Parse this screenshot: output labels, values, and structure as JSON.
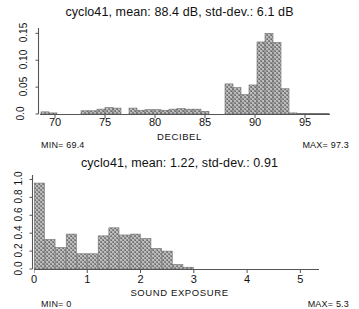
{
  "colors": {
    "bar_fill": "#a3a3a3",
    "bar_edge": "#6e6e6e",
    "axis": "#555555",
    "text": "#111111",
    "background": "#ffffff"
  },
  "panels": [
    {
      "id": "decibel",
      "title": "cyclo41,  mean: 88.4 dB,  std-dev.:  6.1 dB",
      "min_label": "MIN= 69.4",
      "max_label": "MAX= 97.3",
      "chart_data": {
        "type": "bar",
        "title": "cyclo41,  mean: 88.4 dB,  std-dev.:  6.1 dB",
        "xlabel": "DECIBEL",
        "ylabel": "",
        "xlim": [
          68.5,
          97.5
        ],
        "ylim": [
          0.0,
          0.16
        ],
        "xticks": [
          70,
          75,
          80,
          85,
          90,
          95
        ],
        "xtick_labels": [
          "70",
          "75",
          "80",
          "85",
          "90",
          "95"
        ],
        "yticks": [
          0.0,
          0.05,
          0.1,
          0.15
        ],
        "ytick_labels": [
          "0.0",
          "0.05",
          "0.10",
          "0.15"
        ],
        "grid": false,
        "legend": null,
        "bin_width": 0.8,
        "x": [
          69.0,
          69.8,
          70.6,
          73.0,
          73.8,
          74.6,
          75.4,
          76.2,
          77.0,
          77.8,
          78.6,
          79.4,
          80.2,
          81.0,
          81.8,
          82.6,
          83.4,
          84.2,
          85.0,
          85.8,
          86.6,
          87.4,
          88.2,
          89.0,
          89.8,
          90.6,
          91.4,
          92.2,
          93.0,
          93.8,
          94.6,
          95.4,
          96.2,
          97.0
        ],
        "values": [
          0.004,
          0.002,
          0.0,
          0.006,
          0.006,
          0.009,
          0.012,
          0.011,
          0.0,
          0.011,
          0.007,
          0.008,
          0.008,
          0.007,
          0.009,
          0.01,
          0.009,
          0.009,
          0.005,
          0.0,
          0.0,
          0.056,
          0.049,
          0.036,
          0.054,
          0.134,
          0.15,
          0.133,
          0.047,
          0.002,
          0.001,
          0.001,
          0.001,
          0.001
        ]
      }
    },
    {
      "id": "exposure",
      "title": "cyclo41,  mean: 1.22,  std-dev.:  0.91",
      "min_label": "MIN= 0",
      "max_label": "MAX= 5.3",
      "chart_data": {
        "type": "bar",
        "title": "cyclo41,  mean: 1.22,  std-dev.:  0.91",
        "xlabel": "SOUND  EXPOSURE",
        "ylabel": "",
        "xlim": [
          0.0,
          5.35
        ],
        "ylim": [
          0.0,
          1.05
        ],
        "xticks": [
          0,
          1,
          2,
          3,
          4,
          5
        ],
        "xtick_labels": [
          "0",
          "1",
          "2",
          "3",
          "4",
          "5"
        ],
        "yticks": [
          0.0,
          0.2,
          0.4,
          0.6,
          0.8,
          1.0
        ],
        "ytick_labels": [
          "0.0",
          "0.2",
          "0.4",
          "0.6",
          "0.8",
          "1.0"
        ],
        "grid": false,
        "legend": null,
        "bin_width": 0.19,
        "x": [
          0.1,
          0.3,
          0.5,
          0.7,
          0.9,
          1.1,
          1.3,
          1.5,
          1.7,
          1.9,
          2.1,
          2.3,
          2.5,
          2.7,
          2.9,
          3.1
        ],
        "values": [
          0.96,
          0.33,
          0.24,
          0.39,
          0.17,
          0.17,
          0.37,
          0.46,
          0.38,
          0.39,
          0.34,
          0.23,
          0.2,
          0.05,
          0.02,
          0.0
        ]
      }
    }
  ]
}
